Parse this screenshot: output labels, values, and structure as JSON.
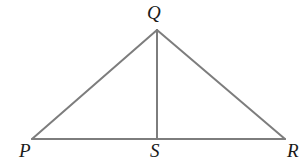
{
  "figure": {
    "type": "geometry-diagram",
    "shape": "triangle-with-altitude",
    "background_color": "#ffffff",
    "line_color": "#7d7d7d",
    "line_width": 2,
    "label_color": "#1a1a1a",
    "labels": {
      "apex": "Q",
      "bottom_left": "P",
      "bottom_middle": "S",
      "bottom_right": "R"
    },
    "points": {
      "P": {
        "x": 32,
        "y": 139
      },
      "Q": {
        "x": 157,
        "y": 30
      },
      "R": {
        "x": 285,
        "y": 139
      },
      "S": {
        "x": 157,
        "y": 139
      }
    },
    "segments": [
      {
        "name": "PQ",
        "from": "P",
        "to": "Q"
      },
      {
        "name": "QR",
        "from": "Q",
        "to": "R"
      },
      {
        "name": "PR",
        "from": "P",
        "to": "R"
      },
      {
        "name": "QS",
        "from": "Q",
        "to": "S"
      }
    ],
    "marker": {
      "name": "bullet",
      "x": 1,
      "y": 13
    }
  }
}
